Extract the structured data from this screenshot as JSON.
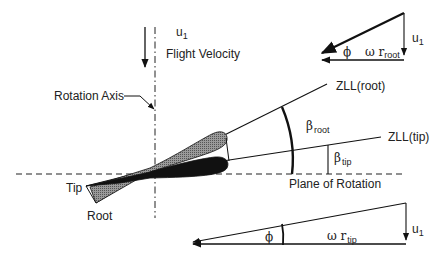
{
  "diagram": {
    "type": "blade-element-geometry",
    "labels": {
      "flight_velocity_symbol": "u",
      "flight_velocity_sub": "1",
      "flight_velocity": "Flight Velocity",
      "rotation_axis": "Rotation Axis",
      "zll_root": "ZLL(root)",
      "zll_tip": "ZLL(tip)",
      "beta": "β",
      "beta_root_sub": "root",
      "beta_tip_sub": "tip",
      "plane_of_rotation": "Plane of Rotation",
      "tip": "Tip",
      "root": "Root"
    },
    "triangle_root": {
      "phi": "ϕ",
      "omega": "ω r",
      "omega_sub": "root",
      "u_symbol": "u",
      "u_sub": "1"
    },
    "triangle_tip": {
      "phi": "ϕ",
      "omega": "ω r",
      "omega_sub": "tip",
      "u_symbol": "u",
      "u_sub": "1"
    },
    "colors": {
      "line": "#111111",
      "blade_root_fill": "#8a8a8a",
      "blade_tip_fill": "#111111",
      "background": "#ffffff"
    }
  }
}
